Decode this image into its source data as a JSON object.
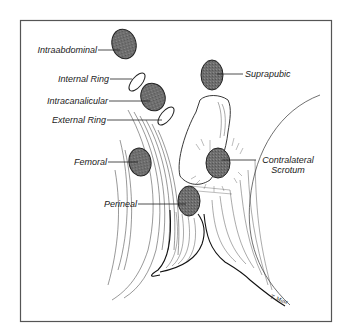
{
  "figure": {
    "signature": "T. Mast",
    "colors": {
      "ellipse_fill": "#6b6b6b",
      "ellipse_stroke": "#222222",
      "line": "#222222",
      "border": "#555555"
    },
    "labels": {
      "intraabdominal": "Intraabdominal",
      "internal_ring": "Internal Ring",
      "intracanalicular": "Intracanalicular",
      "external_ring": "External Ring",
      "suprapubic": "Suprapubic",
      "femoral": "Femoral",
      "contralateral_scrotum_line1": "Contralateral",
      "contralateral_scrotum_line2": "Scrotum",
      "perineal": "Perineal"
    }
  }
}
